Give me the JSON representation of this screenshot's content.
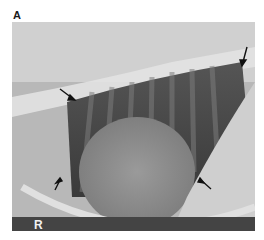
{
  "figure": {
    "panel_label": "A",
    "image_description": "Lateral thoracic radiograph",
    "marker": "R",
    "arrows": [
      {
        "id": "arrow-top-right",
        "x": 243,
        "y": 58,
        "direction": "down"
      },
      {
        "id": "arrow-upper-left",
        "x": 74,
        "y": 100,
        "direction": "down-right"
      },
      {
        "id": "arrow-lower-left",
        "x": 58,
        "y": 181,
        "direction": "up-right"
      },
      {
        "id": "arrow-lower-right",
        "x": 201,
        "y": 180,
        "direction": "up-left"
      }
    ],
    "colors": {
      "background": "#ffffff",
      "arrow": "#111111"
    }
  }
}
